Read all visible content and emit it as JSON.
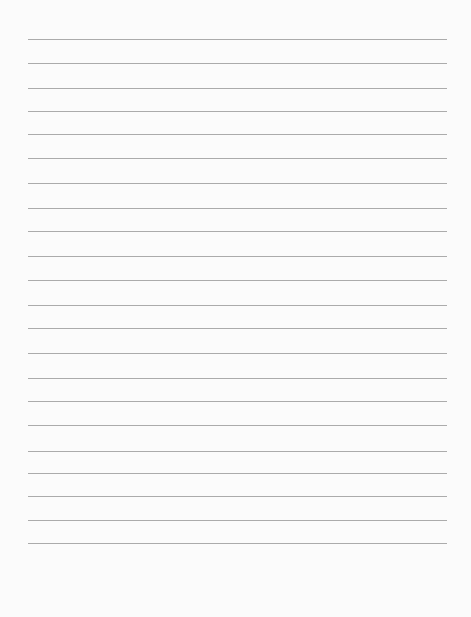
{
  "sheet": {
    "type": "lined-paper",
    "paper_color": "#fbfbfb",
    "rule_color": "#9c9c9c",
    "rule_count": 22,
    "rule_left": 28,
    "rule_width": 419,
    "rule_positions_y": [
      39,
      63,
      88,
      111,
      134,
      158,
      183,
      208,
      231,
      256,
      280,
      305,
      328,
      353,
      378,
      401,
      425,
      451,
      473,
      496,
      520,
      543
    ],
    "text_lines": [
      "",
      "",
      "",
      "",
      "",
      "",
      "",
      "",
      "",
      "",
      "",
      "",
      "",
      "",
      "",
      "",
      "",
      "",
      "",
      "",
      "",
      ""
    ]
  }
}
